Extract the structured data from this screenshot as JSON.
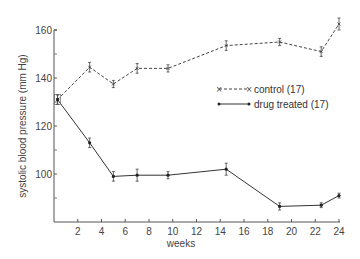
{
  "chart_data": {
    "type": "line",
    "title": "",
    "xlabel": "weeks",
    "ylabel": "systolic blood pressure (mm Hg)",
    "xlim": [
      0,
      24
    ],
    "ylim": [
      80,
      160
    ],
    "x_ticks": [
      2,
      4,
      6,
      8,
      10,
      12,
      14,
      16,
      18,
      20,
      22,
      24
    ],
    "y_ticks_labeled": [
      100,
      120,
      140,
      160
    ],
    "y_ticks_minor": [
      90,
      110,
      130,
      150
    ],
    "grid": false,
    "legend_position": "right-middle",
    "series": [
      {
        "name": "control (17)",
        "style": "dashed",
        "marker": "x",
        "x": [
          0.3,
          3,
          5,
          7,
          9.6,
          14.5,
          19,
          22.5,
          24
        ],
        "values": [
          131,
          144.5,
          137.5,
          144,
          144,
          153.5,
          155,
          151,
          162.5
        ],
        "errors": [
          2,
          2,
          1.5,
          2,
          1.5,
          2,
          1.5,
          2,
          2.5
        ]
      },
      {
        "name": "drug treated (17)",
        "style": "solid",
        "marker": "dot",
        "x": [
          0.3,
          3,
          5,
          7,
          9.6,
          14.5,
          19,
          22.5,
          24
        ],
        "values": [
          131,
          113,
          99,
          99.5,
          99.5,
          102,
          86.5,
          87,
          91
        ],
        "errors": [
          2,
          2,
          2,
          2.5,
          1.5,
          2.5,
          1.5,
          1,
          1
        ]
      }
    ]
  },
  "legend": {
    "control": "control (17)",
    "drug": "drug treated (17)"
  },
  "axes": {
    "xlabel": "weeks",
    "ylabel": "systolic blood pressure (mm Hg)"
  }
}
